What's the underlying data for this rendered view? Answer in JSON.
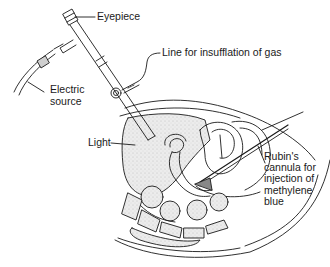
{
  "diagram": {
    "type": "anatomical-illustration",
    "colors": {
      "ink": "#1a1a1a",
      "shading": "#d9d9d9",
      "background": "#ffffff"
    },
    "labels": {
      "eyepiece": "Eyepiece",
      "electric_source": [
        "Electric",
        "source"
      ],
      "insufflation": "Line for insufflation of gas",
      "light": "Light",
      "rubins": [
        "Rubin's",
        "cannula for",
        "injection of",
        "methylene",
        "blue"
      ]
    }
  }
}
